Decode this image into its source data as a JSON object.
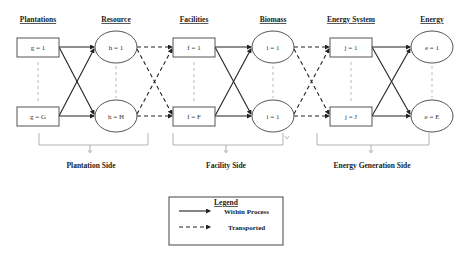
{
  "headers": {
    "plantations": "Plantations",
    "resource": "Resource",
    "facilities": "Facilities",
    "biomass": "Biomass",
    "energy_system": "Energy System",
    "energy": "Energy"
  },
  "nodes": {
    "plantation_top": "g = 1",
    "plantation_bottom": "g = G",
    "resource_top": "h = 1",
    "resource_bottom": "h = H",
    "facility_top": "f = 1",
    "facility_bottom": "f = F",
    "biomass_top": "i = 1",
    "biomass_bottom": "i = 1",
    "energy_system_top": "j = 1",
    "energy_system_bottom": "j = J",
    "energy_top": "e = 1",
    "energy_bottom": "e = E"
  },
  "sides": {
    "plantation": "Plantation Side",
    "facility": "Facility Side",
    "energy_generation": "Energy Generation Side"
  },
  "legend": {
    "title": "Legend",
    "within_process": "Within Process",
    "transported": "Transported"
  },
  "colors": {
    "line": "#222222",
    "node_border": "#555555",
    "guide": "#aaaaaa"
  }
}
